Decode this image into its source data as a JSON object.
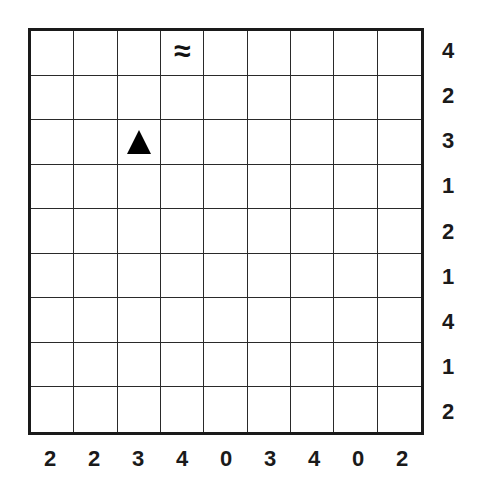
{
  "puzzle": {
    "rows": 9,
    "cols": 9,
    "row_clues": [
      "4",
      "2",
      "3",
      "1",
      "2",
      "1",
      "4",
      "1",
      "2"
    ],
    "col_clues": [
      "2",
      "2",
      "3",
      "4",
      "0",
      "3",
      "4",
      "0",
      "2"
    ],
    "markers": [
      {
        "row": 0,
        "col": 3,
        "icon": "wave-icon",
        "glyph": "≈"
      },
      {
        "row": 2,
        "col": 2,
        "icon": "triangle-icon",
        "glyph": "▲"
      }
    ]
  },
  "colors": {
    "grid_line": "#1a1a1a",
    "background": "#ffffff",
    "text": "#1a1a1a"
  }
}
